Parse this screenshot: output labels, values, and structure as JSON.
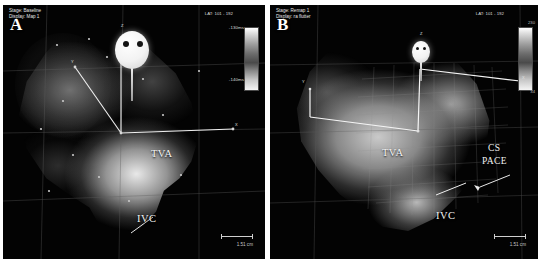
{
  "image": {
    "width": 541,
    "height": 264,
    "background": "#ffffff",
    "modality": "3D electroanatomical mapping (LAT map)"
  },
  "panels": [
    {
      "id": "A",
      "label": "A",
      "header": {
        "stage_line": "Stage: Baseline",
        "display_line": "Display: Map 1"
      },
      "map_mode": "LAT: 101 - 192",
      "colorbar": {
        "top_label": "-130ms",
        "bottom_label": "-140ms",
        "orientation": "vertical"
      },
      "annotations": [
        {
          "name": "tva",
          "text": "TVA"
        },
        {
          "name": "ivc",
          "text": "IVC"
        }
      ],
      "axis_markers": [
        {
          "name": "z-axis",
          "text": "Z"
        },
        {
          "name": "x-axis",
          "text": "X"
        },
        {
          "name": "y-axis",
          "text": "Y"
        }
      ],
      "scale": "1.51 cm",
      "catheter": {
        "name": "balloon-mapping-catheter",
        "electrode_count": 2
      }
    },
    {
      "id": "B",
      "label": "B",
      "header": {
        "stage_line": "Stage: Remap 1",
        "display_line": "Display: ra flutter"
      },
      "map_mode": "LAT: 101 - 192",
      "colorbar": {
        "top_label": "230",
        "bottom_label": "34",
        "orientation": "vertical"
      },
      "annotations": [
        {
          "name": "tva",
          "text": "TVA"
        },
        {
          "name": "ivc",
          "text": "IVC"
        },
        {
          "name": "cs-pace-line1",
          "text": "CS"
        },
        {
          "name": "cs-pace-line2",
          "text": "PACE"
        }
      ],
      "axis_markers": [
        {
          "name": "z-axis",
          "text": "Z"
        },
        {
          "name": "x-axis",
          "text": "X"
        },
        {
          "name": "y-axis",
          "text": "Y"
        }
      ],
      "scale": "1.51 cm",
      "catheter": {
        "name": "mapping-catheter",
        "electrode_count": 2
      }
    }
  ],
  "colors": {
    "panel_background": "#000000",
    "page_background": "#ffffff",
    "overlay_text": "#e8e8e8",
    "annotation_text": "#f2f2f2",
    "grid_line": "#6e6e6e"
  }
}
